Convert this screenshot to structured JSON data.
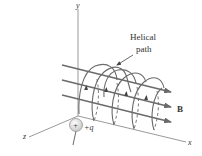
{
  "figure": {
    "title_label": "Helical path",
    "title_lines": [
      "Helical",
      "path"
    ],
    "axes": {
      "x_label": "x",
      "y_label": "y",
      "z_label": "z"
    },
    "field_label": "B",
    "charge": {
      "symbol": "+",
      "label": "+q"
    },
    "colors": {
      "line": "#6b6b6b",
      "axis": "#808080",
      "text": "#333333",
      "charge_fill": "#e6e6e6"
    }
  }
}
